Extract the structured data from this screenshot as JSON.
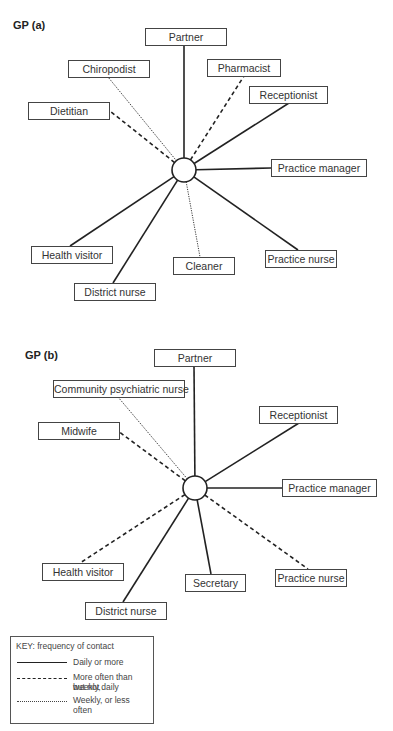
{
  "diagrams": [
    {
      "id": "a",
      "title": "GP (a)",
      "hub": {
        "x": 184,
        "y": 170,
        "r": 12
      },
      "nodes": [
        {
          "label": "Partner",
          "x": 145,
          "y": 28,
          "w": 80,
          "ax": 184,
          "ay": 45,
          "freq": "daily"
        },
        {
          "label": "Chiropodist",
          "x": 68,
          "y": 60,
          "w": 80,
          "ax": 108,
          "ay": 77,
          "freq": "weekly"
        },
        {
          "label": "Pharmacist",
          "x": 207,
          "y": 59,
          "w": 72,
          "ax": 244,
          "ay": 76,
          "freq": "more_than_weekly"
        },
        {
          "label": "Receptionist",
          "x": 249,
          "y": 86,
          "w": 77,
          "ax": 289,
          "ay": 103,
          "freq": "daily"
        },
        {
          "label": "Dietitian",
          "x": 28,
          "y": 102,
          "w": 80,
          "ax": 110,
          "ay": 111,
          "freq": "more_than_weekly"
        },
        {
          "label": "Practice manager",
          "x": 271,
          "y": 159,
          "w": 94,
          "ax": 271,
          "ay": 168,
          "freq": "daily"
        },
        {
          "label": "Health visitor",
          "x": 31,
          "y": 246,
          "w": 80,
          "ax": 70,
          "ay": 246,
          "freq": "daily"
        },
        {
          "label": "Cleaner",
          "x": 173,
          "y": 257,
          "w": 60,
          "ax": 200,
          "ay": 257,
          "freq": "weekly"
        },
        {
          "label": "Practice nurse",
          "x": 265,
          "y": 250,
          "w": 70,
          "ax": 298,
          "ay": 250,
          "freq": "daily"
        },
        {
          "label": "District nurse",
          "x": 74,
          "y": 283,
          "w": 80,
          "ax": 113,
          "ay": 283,
          "freq": "daily"
        }
      ]
    },
    {
      "id": "b",
      "title": "GP (b)",
      "hub": {
        "x": 195,
        "y": 488,
        "r": 12
      },
      "nodes": [
        {
          "label": "Partner",
          "x": 154,
          "y": 349,
          "w": 80,
          "ax": 194,
          "ay": 366,
          "freq": "daily"
        },
        {
          "label": "Community psychiatric nurse",
          "x": 53,
          "y": 380,
          "w": 130,
          "ax": 118,
          "ay": 397,
          "freq": "weekly"
        },
        {
          "label": "Receptionist",
          "x": 259,
          "y": 406,
          "w": 77,
          "ax": 299,
          "ay": 423,
          "freq": "daily"
        },
        {
          "label": "Midwife",
          "x": 38,
          "y": 422,
          "w": 80,
          "ax": 118,
          "ay": 431,
          "freq": "more_than_weekly"
        },
        {
          "label": "Practice manager",
          "x": 282,
          "y": 479,
          "w": 93,
          "ax": 282,
          "ay": 488,
          "freq": "daily"
        },
        {
          "label": "Health visitor",
          "x": 42,
          "y": 563,
          "w": 80,
          "ax": 80,
          "ay": 563,
          "freq": "more_than_weekly"
        },
        {
          "label": "Secretary",
          "x": 185,
          "y": 574,
          "w": 59,
          "ax": 211,
          "ay": 574,
          "freq": "daily"
        },
        {
          "label": "Practice nurse",
          "x": 275,
          "y": 569,
          "w": 70,
          "ax": 308,
          "ay": 569,
          "freq": "more_than_weekly"
        },
        {
          "label": "District nurse",
          "x": 85,
          "y": 602,
          "w": 80,
          "ax": 123,
          "ay": 602,
          "freq": "daily"
        }
      ]
    }
  ],
  "key": {
    "title": "KEY: frequency of contact",
    "items": [
      {
        "style": "solid",
        "label_line1": "Daily or more",
        "label_line2": ""
      },
      {
        "style": "dashed",
        "label_line1": "More often than weekly,",
        "label_line2": "but not daily"
      },
      {
        "style": "dotted",
        "label_line1": "Weekly, or less",
        "label_line2": "often"
      }
    ]
  },
  "colors": {
    "line": "#222222",
    "box_border": "#444444",
    "text": "#333333"
  }
}
